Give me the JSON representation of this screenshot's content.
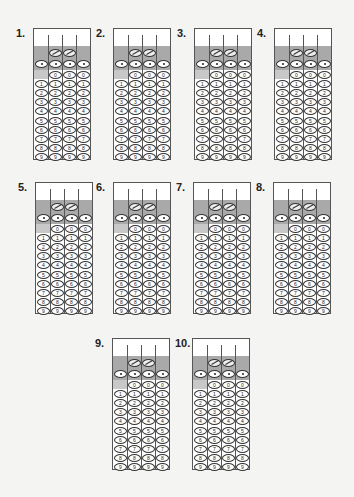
{
  "page": {
    "grid_columns": 4,
    "fraction_bar_columns": [
      2,
      3
    ],
    "decimal_point_columns": [
      1,
      2,
      3,
      4
    ],
    "digits": [
      "0",
      "1",
      "2",
      "3",
      "4",
      "5",
      "6",
      "7",
      "8",
      "9"
    ],
    "first_column_digits": [
      "1",
      "2",
      "3",
      "4",
      "5",
      "6",
      "7",
      "8",
      "9"
    ]
  },
  "questions": [
    {
      "number": "1.",
      "x": 33,
      "y": 28
    },
    {
      "number": "2.",
      "x": 113,
      "y": 28
    },
    {
      "number": "3.",
      "x": 194,
      "y": 28
    },
    {
      "number": "4.",
      "x": 274,
      "y": 28
    },
    {
      "number": "5.",
      "x": 35,
      "y": 182
    },
    {
      "number": "6.",
      "x": 113,
      "y": 182
    },
    {
      "number": "7.",
      "x": 193,
      "y": 182
    },
    {
      "number": "8.",
      "x": 273,
      "y": 182
    },
    {
      "number": "9.",
      "x": 112,
      "y": 338
    },
    {
      "number": "10.",
      "x": 192,
      "y": 338
    }
  ],
  "colors": {
    "background": "#f4f4f2",
    "band": "#a9a9a9",
    "border": "#555555",
    "bubble_fill": "#ffffff"
  }
}
